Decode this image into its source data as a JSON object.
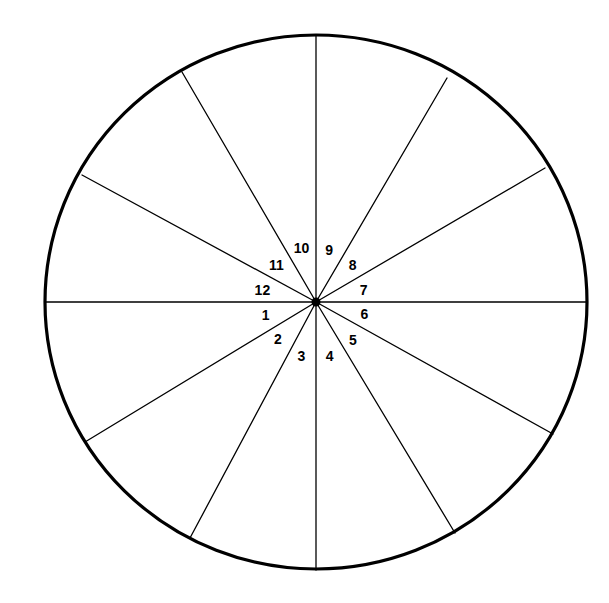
{
  "figure": {
    "background_color": "#ffffff",
    "stroke_color": "#000000",
    "rim_stroke_width": 3.2,
    "divider_stroke_width": 1.3,
    "center_dot_radius": 4.5
  },
  "chart_data": {
    "type": "pie",
    "title": "",
    "subtitle": "",
    "xlabel": "",
    "ylabel": "",
    "legend_position": "none",
    "grid": false,
    "center_x": 316,
    "center_y": 302,
    "radius_x": 271,
    "radius_y": 267,
    "categories": [
      "1",
      "2",
      "3",
      "4",
      "5",
      "6",
      "7",
      "8",
      "9",
      "10",
      "11",
      "12"
    ],
    "values": [
      28,
      32,
      33,
      28,
      35,
      28,
      28,
      34,
      28,
      35,
      30,
      31
    ],
    "units": "degrees",
    "direction": "counterclockwise",
    "boundary_angles_deg": [
      180,
      208,
      240,
      270,
      297,
      332,
      360,
      28,
      62,
      90,
      120,
      155
    ],
    "sectors": [
      {
        "label": "1",
        "start_deg": 180,
        "end_deg": 208,
        "label_angle_deg": 194,
        "label_radius": 52
      },
      {
        "label": "2",
        "start_deg": 208,
        "end_deg": 240,
        "label_angle_deg": 224,
        "label_radius": 53
      },
      {
        "label": "3",
        "start_deg": 240,
        "end_deg": 270,
        "label_angle_deg": 255,
        "label_radius": 56
      },
      {
        "label": "4",
        "start_deg": 270,
        "end_deg": 297,
        "label_angle_deg": 284,
        "label_radius": 56
      },
      {
        "label": "5",
        "start_deg": 297,
        "end_deg": 332,
        "label_angle_deg": 314,
        "label_radius": 53
      },
      {
        "label": "6",
        "start_deg": 332,
        "end_deg": 360,
        "label_angle_deg": 346,
        "label_radius": 50
      },
      {
        "label": "7",
        "start_deg": 0,
        "end_deg": 28,
        "label_angle_deg": 14,
        "label_radius": 49
      },
      {
        "label": "8",
        "start_deg": 28,
        "end_deg": 62,
        "label_angle_deg": 45,
        "label_radius": 52
      },
      {
        "label": "9",
        "start_deg": 62,
        "end_deg": 90,
        "label_angle_deg": 76,
        "label_radius": 54
      },
      {
        "label": "10",
        "start_deg": 90,
        "end_deg": 120,
        "label_angle_deg": 105,
        "label_radius": 56
      },
      {
        "label": "11",
        "start_deg": 120,
        "end_deg": 155,
        "label_angle_deg": 137,
        "label_radius": 54
      },
      {
        "label": "12",
        "start_deg": 155,
        "end_deg": 180,
        "label_angle_deg": 167,
        "label_radius": 55
      }
    ],
    "rim_endpoints": [
      {
        "label": "right",
        "x": 587,
        "y": 302
      },
      {
        "label": "upper-right",
        "x": 545,
        "y": 168
      },
      {
        "label": "upper-right-steep",
        "x": 447,
        "y": 78
      },
      {
        "label": "top",
        "x": 316,
        "y": 35
      },
      {
        "label": "upper-left-steep",
        "x": 182,
        "y": 72
      },
      {
        "label": "upper-left",
        "x": 82,
        "y": 175
      },
      {
        "label": "left",
        "x": 45,
        "y": 302
      },
      {
        "label": "lower-left",
        "x": 85,
        "y": 442
      },
      {
        "label": "lower-left-steep",
        "x": 190,
        "y": 538
      },
      {
        "label": "bottom",
        "x": 316,
        "y": 570
      },
      {
        "label": "lower-right-steep",
        "x": 455,
        "y": 533
      },
      {
        "label": "lower-right",
        "x": 553,
        "y": 434
      }
    ]
  },
  "labels": {
    "s1": "1",
    "s2": "2",
    "s3": "3",
    "s4": "4",
    "s5": "5",
    "s6": "6",
    "s7": "7",
    "s8": "8",
    "s9": "9",
    "s10": "10",
    "s11": "11",
    "s12": "12"
  }
}
